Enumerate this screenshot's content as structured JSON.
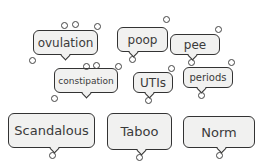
{
  "bubbles": [
    {
      "label": "ovulation",
      "x": 33,
      "y": 30,
      "w": 65,
      "h": 25,
      "fs": 12
    },
    {
      "label": "poop",
      "x": 117,
      "y": 27,
      "w": 51,
      "h": 25,
      "fs": 12
    },
    {
      "label": "pee",
      "x": 170,
      "y": 34,
      "w": 50,
      "h": 21,
      "fs": 12
    },
    {
      "label": "constipation",
      "x": 54,
      "y": 68,
      "w": 64,
      "h": 25,
      "fs": 9
    },
    {
      "label": "UTIs",
      "x": 133,
      "y": 72,
      "w": 40,
      "h": 21,
      "fs": 12
    },
    {
      "label": "periods",
      "x": 183,
      "y": 67,
      "w": 50,
      "h": 21,
      "fs": 10
    },
    {
      "label": "Scandalous",
      "x": 8,
      "y": 113,
      "w": 87,
      "h": 35,
      "fs": 13
    },
    {
      "label": "Taboo",
      "x": 107,
      "y": 113,
      "w": 65,
      "h": 37,
      "fs": 13
    },
    {
      "label": "Norm",
      "x": 183,
      "y": 116,
      "w": 72,
      "h": 32,
      "fs": 13
    }
  ],
  "colors": {
    "bubble_fill": "#f1f1f0",
    "stroke": "#333333",
    "text": "#3a3a3a",
    "background": "#ffffff"
  }
}
